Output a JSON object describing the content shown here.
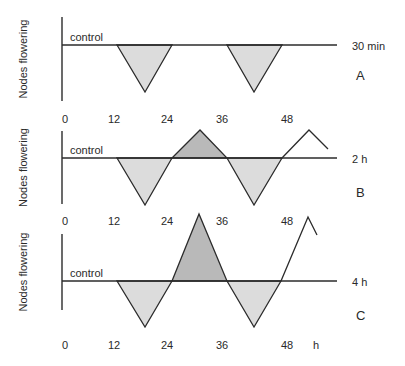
{
  "figure": {
    "panels": [
      {
        "id": "A",
        "label": "A",
        "condition": "30 min",
        "ylabel": "Nodes flowering",
        "baseline_label": "control",
        "ticks": [
          "0",
          "12",
          "24",
          "36",
          "48"
        ],
        "geometry": {
          "axis": {
            "x": 62,
            "top": 17,
            "bottom": 101
          },
          "baseline_y": 45,
          "baseline_end_x": 337,
          "tick_y": 123,
          "label_y": 80,
          "cond_y": 50,
          "shapes": [
            {
              "type": "dip",
              "points": [
                [
                  117,
                  45
                ],
                [
                  145,
                  92
                ],
                [
                  172,
                  45
                ]
              ]
            },
            {
              "type": "dip",
              "points": [
                [
                  227,
                  45
                ],
                [
                  254,
                  92
                ],
                [
                  282,
                  45
                ]
              ]
            }
          ],
          "tail": []
        }
      },
      {
        "id": "B",
        "label": "B",
        "condition": "2 h",
        "ylabel": "Nodes flowering",
        "baseline_label": "control",
        "ticks": [
          "0",
          "12",
          "24",
          "36",
          "48"
        ],
        "geometry": {
          "axis": {
            "x": 62,
            "top": 131,
            "bottom": 204
          },
          "baseline_y": 158,
          "baseline_end_x": 337,
          "tick_y": 225,
          "label_y": 197,
          "cond_y": 163,
          "shapes": [
            {
              "type": "dip",
              "points": [
                [
                  117,
                  158
                ],
                [
                  145,
                  205
                ],
                [
                  172,
                  158
                ]
              ]
            },
            {
              "type": "peak",
              "points": [
                [
                  172,
                  158
                ],
                [
                  200,
                  130
                ],
                [
                  227,
                  158
                ]
              ]
            },
            {
              "type": "dip",
              "points": [
                [
                  227,
                  158
                ],
                [
                  254,
                  205
                ],
                [
                  282,
                  158
                ]
              ]
            }
          ],
          "tail": [
            [
              282,
              158
            ],
            [
              309,
              130
            ],
            [
              328,
              149
            ]
          ]
        }
      },
      {
        "id": "C",
        "label": "C",
        "condition": "4 h",
        "ylabel": "Nodes flowering",
        "baseline_label": "control",
        "ticks": [
          "0",
          "12",
          "24",
          "36",
          "48",
          "h"
        ],
        "geometry": {
          "axis": {
            "x": 62,
            "top": 234,
            "bottom": 310
          },
          "baseline_y": 281,
          "baseline_end_x": 337,
          "tick_y": 349,
          "label_y": 320,
          "cond_y": 286,
          "shapes": [
            {
              "type": "dip",
              "points": [
                [
                  117,
                  281
                ],
                [
                  145,
                  327
                ],
                [
                  172,
                  281
                ]
              ]
            },
            {
              "type": "peak",
              "points": [
                [
                  172,
                  281
                ],
                [
                  199,
                  214
                ],
                [
                  227,
                  281
                ]
              ]
            },
            {
              "type": "dip",
              "points": [
                [
                  227,
                  281
                ],
                [
                  254,
                  327
                ],
                [
                  281,
                  281
                ]
              ]
            }
          ],
          "tail": [
            [
              281,
              281
            ],
            [
              308,
              217
            ],
            [
              317,
              235
            ]
          ]
        }
      }
    ],
    "tick_x": [
      65,
      114,
      167,
      222,
      287,
      316
    ],
    "colors": {
      "line": "#2b2b2b",
      "dip_fill": "#dcdcdc",
      "peak_fill": "#b9b9b9",
      "text": "#2a2a2a"
    }
  },
  "chart_data": {
    "type": "line",
    "title": "",
    "xlabel": "h",
    "ylabel": "Nodes flowering",
    "x_ticks": [
      0,
      12,
      24,
      36,
      48
    ],
    "xlim": [
      0,
      54
    ],
    "grid": false,
    "legend": "none",
    "reference_line": "control",
    "annotations": [
      "control",
      "30 min",
      "2 h",
      "4 h",
      "A",
      "B",
      "C"
    ],
    "series": [
      {
        "name": "30 min (A)",
        "note": "relative to control = 0; negative = fewer nodes flowering (light shaded), positive = more (dark shaded)",
        "x": [
          0,
          14,
          20,
          26,
          38,
          44,
          50,
          54
        ],
        "values": [
          0,
          0,
          -1,
          0,
          0,
          -1,
          0,
          0
        ]
      },
      {
        "name": "2 h (B)",
        "x": [
          0,
          14,
          20,
          26,
          32,
          38,
          44,
          50,
          56,
          60
        ],
        "values": [
          0,
          0,
          -1,
          0,
          0.6,
          0,
          -1,
          0,
          0.6,
          0.2
        ]
      },
      {
        "name": "4 h (C)",
        "x": [
          0,
          14,
          20,
          26,
          32,
          38,
          44,
          50,
          56,
          58
        ],
        "values": [
          0,
          0,
          -1,
          0,
          1.4,
          0,
          -1,
          0,
          1.4,
          1.0
        ]
      }
    ]
  }
}
